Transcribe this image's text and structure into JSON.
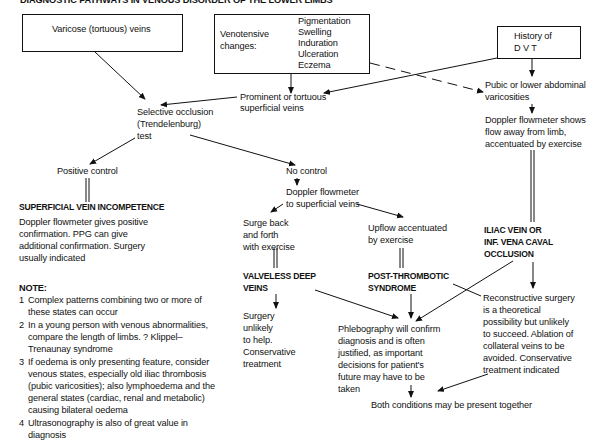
{
  "title": "DIAGNOSTIC PATHWAYS IN VENOUS DISORDER OF THE LOWER LIMBS",
  "boxes": {
    "varicose": "Varicose (tortuous) veins",
    "venotensive_label": [
      "Venotensive",
      "changes:"
    ],
    "venotensive_items": [
      "Pigmentation",
      "Swelling",
      "Induration",
      "Ulceration",
      "Eczema"
    ],
    "history_dvt": [
      "History of",
      "D V T"
    ]
  },
  "nodes": {
    "prominent": [
      "Prominent or tortuous",
      "superficial veins"
    ],
    "pubic": [
      "Pubic or lower abdominal",
      "varicosities"
    ],
    "selective_occlusion": [
      "Selective occlusion",
      "(Trendelenburg)",
      "test"
    ],
    "doppler_away": [
      "Doppler flowmeter shows",
      "flow away from limb,",
      "accentuated by exercise"
    ],
    "positive_control": "Positive control",
    "no_control": "No control",
    "doppler_superficial": [
      "Doppler flowmeter",
      "to superficial veins"
    ],
    "svi_heading": "SUPERFICIAL VEIN INCOMPETENCE",
    "svi_text": [
      "Doppler flowmeter gives positive",
      "confirmation.  PPG can give",
      "additional confirmation.  Surgery",
      "usually  indicated"
    ],
    "surge": [
      "Surge back",
      "and forth",
      "with exercise"
    ],
    "upflow": [
      "Upflow accentuated",
      "by exercise"
    ],
    "iliac": [
      "ILIAC VEIN OR",
      "INF. VENA CAVAL",
      "OCCLUSION"
    ],
    "valveless": [
      "VALVELESS DEEP",
      "VEINS"
    ],
    "post_thrombotic": [
      "POST-THROMBOTIC",
      "SYNDROME"
    ],
    "surgery_unlikely": [
      "Surgery",
      "unlikely",
      "to help.",
      "Conservative",
      "treatment"
    ],
    "reconstructive": [
      "Reconstructive surgery",
      "is a theoretical",
      "possibility but unlikely",
      "to succeed.  Ablation of",
      "collateral veins to be",
      "avoided.  Conservative",
      "treatment indicated"
    ],
    "phlebography": [
      "Phlebography will confirm",
      "diagnosis and is often",
      "justified, as important",
      "decisions for patient's",
      "future may have to be",
      "taken"
    ],
    "both_conditions": "Both conditions may be present together"
  },
  "note": {
    "heading": "NOTE:",
    "items": [
      {
        "num": "1",
        "lines": [
          "Complex patterns combining two or more of",
          "these states can occur"
        ]
      },
      {
        "num": "2",
        "lines": [
          "In a young person with venous abnormalities,",
          "compare the length of limbs.  ? Klippel–",
          "Trenaunay syndrome"
        ]
      },
      {
        "num": "3",
        "lines": [
          "If oedema is only presenting feature, consider",
          "venous states, especially old iliac thrombosis",
          "(pubic varicosities); also lymphoedema and the",
          "general states (cardiac, renal and metabolic)",
          "causing bilateral oedema"
        ]
      },
      {
        "num": "4",
        "lines": [
          "Ultrasonography is also of great value in",
          "diagnosis"
        ]
      }
    ]
  }
}
